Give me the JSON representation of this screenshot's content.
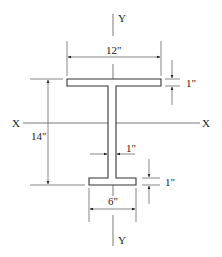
{
  "diagram": {
    "type": "I-beam cross-section (unequal flanges)",
    "axes": {
      "x_axis_left_label": "X",
      "x_axis_right_label": "X",
      "y_axis_top_label": "Y",
      "y_axis_bottom_label": "Y"
    },
    "dimensions": {
      "top_flange_width": "12\"",
      "top_flange_thickness": "1\"",
      "overall_depth": "14\"",
      "web_thickness": "1\"",
      "bottom_flange_thickness": "1\"",
      "bottom_flange_width": "6\""
    },
    "colors": {
      "line": "#333333",
      "dim_line": "#555555",
      "background": "#ffffff"
    }
  }
}
